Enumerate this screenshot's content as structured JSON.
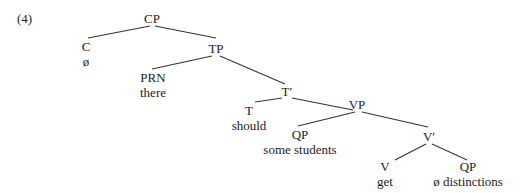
{
  "example_number": "(4)",
  "tree": {
    "nodes": [
      {
        "id": "CP",
        "label": "CP",
        "word": ""
      },
      {
        "id": "C",
        "label": "C",
        "word": "ø"
      },
      {
        "id": "TP",
        "label": "TP",
        "word": ""
      },
      {
        "id": "PRN",
        "label": "PRN",
        "word": "there"
      },
      {
        "id": "Tbar",
        "label": "T′",
        "word": ""
      },
      {
        "id": "T",
        "label": "T",
        "word": "should"
      },
      {
        "id": "VP",
        "label": "VP",
        "word": ""
      },
      {
        "id": "QP1",
        "label": "QP",
        "word": "some students"
      },
      {
        "id": "Vbar",
        "label": "V′",
        "word": ""
      },
      {
        "id": "V",
        "label": "V",
        "word": "get"
      },
      {
        "id": "QP2",
        "label": "QP",
        "word": "ø distinctions"
      }
    ],
    "edges": [
      [
        "CP",
        "C"
      ],
      [
        "CP",
        "TP"
      ],
      [
        "TP",
        "PRN"
      ],
      [
        "TP",
        "Tbar"
      ],
      [
        "Tbar",
        "T"
      ],
      [
        "Tbar",
        "VP"
      ],
      [
        "VP",
        "QP1"
      ],
      [
        "VP",
        "Vbar"
      ],
      [
        "Vbar",
        "V"
      ],
      [
        "Vbar",
        "QP2"
      ]
    ]
  }
}
